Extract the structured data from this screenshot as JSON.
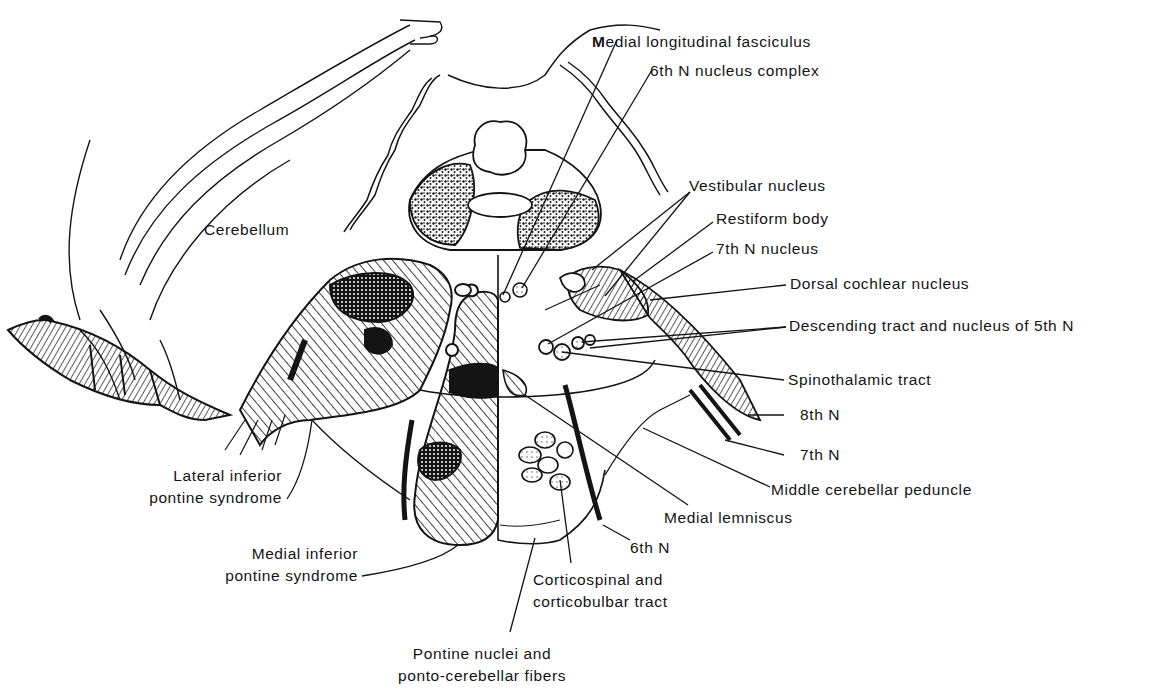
{
  "figure": {
    "colors": {
      "ink": "#141414",
      "background": "#ffffff"
    }
  },
  "labels": {
    "mlf": "Medial longitudinal fasciculus",
    "sixth_nucleus": "6th N nucleus complex",
    "vestibular": "Vestibular nucleus",
    "restiform": "Restiform body",
    "seventh_nucleus": "7th N nucleus",
    "dorsal_cochlear": "Dorsal cochlear nucleus",
    "descending_5th": "Descending tract and nucleus of 5th N",
    "spinothalamic": "Spinothalamic tract",
    "eighth_n": "8th N",
    "seventh_n": "7th N",
    "mcp": "Middle cerebellar peduncle",
    "medial_lemniscus": "Medial lemniscus",
    "sixth_n": "6th N",
    "corticospinal_1": "Corticospinal and",
    "corticospinal_2": "corticobulbar tract",
    "pontine_1": "Pontine nuclei and",
    "pontine_2": "ponto-cerebellar fibers",
    "cerebellum": "Cerebellum",
    "lateral_1": "Lateral inferior",
    "lateral_2": "pontine syndrome",
    "medial_1": "Medial inferior",
    "medial_2": "pontine syndrome"
  }
}
